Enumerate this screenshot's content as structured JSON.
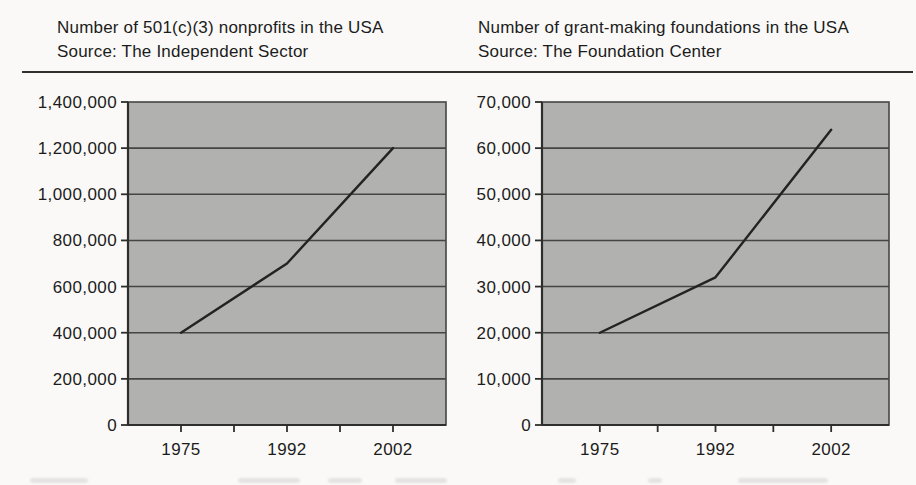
{
  "page": {
    "background": "#faf9f7",
    "divider_color": "#30302e",
    "text_color": "#1c1c1c"
  },
  "chart_data": [
    {
      "type": "line",
      "title": "Number of 501(c)(3) nonprofits in the USA",
      "subtitle": "Source: The Independent Sector",
      "categories": [
        "1975",
        "1992",
        "2002"
      ],
      "values": [
        400000,
        700000,
        1200000
      ],
      "xlabel": "",
      "ylabel": "",
      "ylim": [
        0,
        1400000
      ],
      "ytick_step": 200000,
      "ytick_labels": [
        "0",
        "200,000",
        "400,000",
        "600,000",
        "800,000",
        "1,000,000",
        "1,200,000",
        "1,400,000"
      ],
      "grid": true,
      "legend": "none",
      "plot_bg": "#b1b1af",
      "grid_color": "#454543",
      "axis_color": "#2e2e2c",
      "line_color": "#232323"
    },
    {
      "type": "line",
      "title": "Number of grant-making foundations in the USA",
      "subtitle": "Source: The Foundation Center",
      "categories": [
        "1975",
        "1992",
        "2002"
      ],
      "values": [
        20000,
        32000,
        64000
      ],
      "xlabel": "",
      "ylabel": "",
      "ylim": [
        0,
        70000
      ],
      "ytick_step": 10000,
      "ytick_labels": [
        "0",
        "10,000",
        "20,000",
        "30,000",
        "40,000",
        "50,000",
        "60,000",
        "70,000"
      ],
      "grid": true,
      "legend": "none",
      "plot_bg": "#b1b1af",
      "grid_color": "#454543",
      "axis_color": "#2e2e2c",
      "line_color": "#232323"
    }
  ]
}
